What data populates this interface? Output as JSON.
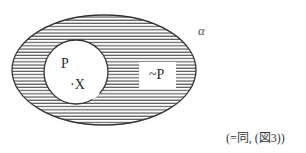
{
  "diagram": {
    "type": "venn-like set diagram",
    "universe": {
      "label": "α",
      "shape": "ellipse",
      "fill": "horizontal hatching"
    },
    "inner_set": {
      "label": "P",
      "shape": "circle",
      "fill": "white"
    },
    "element": {
      "label": "·X"
    },
    "complement_box": {
      "label": "~P"
    },
    "caption": "(=同, (図3))",
    "colors": {
      "stroke": "#333333",
      "hatch": "#555555",
      "background": "#ffffff"
    }
  }
}
